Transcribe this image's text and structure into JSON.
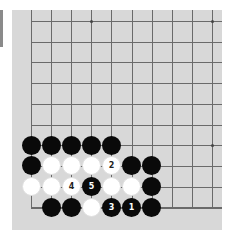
{
  "board": {
    "background": "#d8d8d8",
    "grid": {
      "origin_x": 19,
      "origin_y": 11,
      "col_spacing": 20.1,
      "row_spacing": 20.7,
      "cols": 10,
      "rows": 10,
      "left_edge_visible": true,
      "bottom_edge_visible": true
    },
    "star_points": [
      {
        "col": 3,
        "row": 0
      },
      {
        "col": 9,
        "row": 0
      },
      {
        "col": 9,
        "row": 6
      }
    ],
    "stones": [
      {
        "col": 0,
        "row": 6,
        "color": "black",
        "label": ""
      },
      {
        "col": 1,
        "row": 6,
        "color": "black",
        "label": ""
      },
      {
        "col": 2,
        "row": 6,
        "color": "black",
        "label": ""
      },
      {
        "col": 3,
        "row": 6,
        "color": "black",
        "label": ""
      },
      {
        "col": 4,
        "row": 6,
        "color": "black",
        "label": ""
      },
      {
        "col": 0,
        "row": 7,
        "color": "black",
        "label": ""
      },
      {
        "col": 1,
        "row": 7,
        "color": "white",
        "label": ""
      },
      {
        "col": 2,
        "row": 7,
        "color": "white",
        "label": ""
      },
      {
        "col": 3,
        "row": 7,
        "color": "white",
        "label": ""
      },
      {
        "col": 4,
        "row": 7,
        "color": "white",
        "label": "2"
      },
      {
        "col": 5,
        "row": 7,
        "color": "black",
        "label": ""
      },
      {
        "col": 6,
        "row": 7,
        "color": "black",
        "label": ""
      },
      {
        "col": 0,
        "row": 8,
        "color": "white",
        "label": ""
      },
      {
        "col": 1,
        "row": 8,
        "color": "white",
        "label": ""
      },
      {
        "col": 2,
        "row": 8,
        "color": "white",
        "label": "4"
      },
      {
        "col": 3,
        "row": 8,
        "color": "black",
        "label": "5"
      },
      {
        "col": 4,
        "row": 8,
        "color": "white",
        "label": ""
      },
      {
        "col": 5,
        "row": 8,
        "color": "white",
        "label": ""
      },
      {
        "col": 6,
        "row": 8,
        "color": "black",
        "label": ""
      },
      {
        "col": 1,
        "row": 9,
        "color": "black",
        "label": ""
      },
      {
        "col": 2,
        "row": 9,
        "color": "black",
        "label": ""
      },
      {
        "col": 3,
        "row": 9,
        "color": "white",
        "label": ""
      },
      {
        "col": 4,
        "row": 9,
        "color": "black",
        "label": "3"
      },
      {
        "col": 5,
        "row": 9,
        "color": "black",
        "label": "1"
      },
      {
        "col": 6,
        "row": 9,
        "color": "black",
        "label": ""
      }
    ]
  }
}
